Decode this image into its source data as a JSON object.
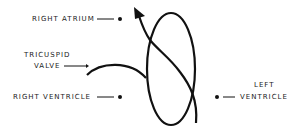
{
  "diagram": {
    "labels": {
      "right_atrium": "RIGHT ATRIUM",
      "tricuspid_line1": "TRICUSPID",
      "tricuspid_line2": "VALVE",
      "right_ventricle": "RIGHT VENTRICLE",
      "left_line1": "LEFT",
      "left_line2": "VENTRICLE"
    },
    "colors": {
      "stroke": "#111111",
      "text": "#1a1a1a",
      "background": "#ffffff"
    }
  }
}
